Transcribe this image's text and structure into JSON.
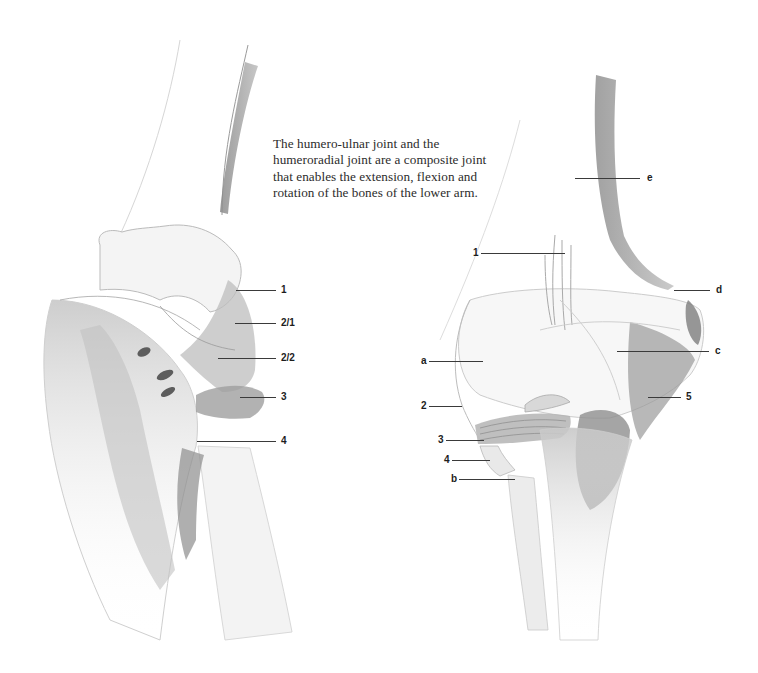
{
  "caption": {
    "lines": [
      "The humero-ulnar joint and the",
      "humeroradial joint are a composite joint",
      "that enables the extension, flexion and",
      "rotation of the bones of the lower arm."
    ]
  },
  "figures": [
    {
      "id": "left-elbow-lateral-view",
      "labels": [
        {
          "text": "1",
          "x": 281,
          "y": 290,
          "line_from": 236,
          "line_to": 276
        },
        {
          "text": "2/1",
          "x": 281,
          "y": 323,
          "line_from": 235,
          "line_to": 276
        },
        {
          "text": "2/2",
          "x": 281,
          "y": 358,
          "line_from": 218,
          "line_to": 276
        },
        {
          "text": "3",
          "x": 281,
          "y": 397,
          "line_from": 240,
          "line_to": 276
        },
        {
          "text": "4",
          "x": 281,
          "y": 441,
          "line_from": 197,
          "line_to": 276
        }
      ]
    },
    {
      "id": "right-elbow-posterior-view",
      "labels": [
        {
          "text": "e",
          "x": 647,
          "y": 178,
          "line_from": 575,
          "line_to": 640,
          "side": "right"
        },
        {
          "text": "1",
          "x": 473,
          "y": 253,
          "line_from": 481,
          "line_to": 565,
          "side": "left"
        },
        {
          "text": "d",
          "x": 716,
          "y": 290,
          "line_from": 674,
          "line_to": 710,
          "side": "right"
        },
        {
          "text": "c",
          "x": 715,
          "y": 351,
          "line_from": 617,
          "line_to": 709,
          "side": "right"
        },
        {
          "text": "a",
          "x": 421,
          "y": 361,
          "line_from": 429,
          "line_to": 483,
          "side": "left"
        },
        {
          "text": "5",
          "x": 686,
          "y": 397,
          "line_from": 648,
          "line_to": 681,
          "side": "right"
        },
        {
          "text": "2",
          "x": 421,
          "y": 406,
          "line_from": 429,
          "line_to": 462,
          "side": "left"
        },
        {
          "text": "3",
          "x": 438,
          "y": 440,
          "line_from": 446,
          "line_to": 484,
          "side": "left"
        },
        {
          "text": "4",
          "x": 444,
          "y": 460,
          "line_from": 452,
          "line_to": 490,
          "side": "left"
        },
        {
          "text": "b",
          "x": 451,
          "y": 479,
          "line_from": 459,
          "line_to": 515,
          "side": "left"
        }
      ]
    }
  ],
  "colors": {
    "background": "#ffffff",
    "text": "#2b2b2b",
    "leader_line": "#3a3a3a",
    "pencil_dark": "#6e6e6e",
    "pencil_mid": "#a9a9a9",
    "pencil_light": "#d8d8d8"
  }
}
